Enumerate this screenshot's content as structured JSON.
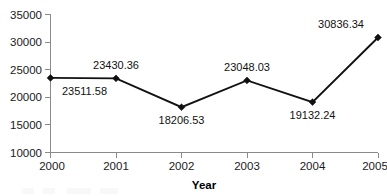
{
  "chart_data": {
    "type": "line",
    "title": "",
    "subtitle": "",
    "xlabel": "Year",
    "ylabel": "",
    "categories": [
      "2000",
      "2001",
      "2002",
      "2003",
      "2004",
      "2005"
    ],
    "values": [
      23511.58,
      23430.36,
      18206.53,
      23048.03,
      19132.24,
      30836.34
    ],
    "point_labels": [
      "23511.58",
      "23430.36",
      "18206.53",
      "23048.03",
      "19132.24",
      "30836.34"
    ],
    "point_label_positions": [
      "below",
      "above",
      "below",
      "above",
      "below",
      "above"
    ],
    "series": [
      {
        "name": "",
        "values": [
          23511.58,
          23430.36,
          18206.53,
          23048.03,
          19132.24,
          30836.34
        ]
      }
    ],
    "ylim": [
      10000,
      35000
    ],
    "ytick_labels": [
      "35000",
      "30000",
      "25000",
      "20000",
      "15000",
      "10000"
    ],
    "ytick_values": [
      35000,
      30000,
      25000,
      20000,
      15000,
      10000
    ],
    "xtick_labels": [
      "2000",
      "2001",
      "2002",
      "2003",
      "2004",
      "2005"
    ],
    "grid": false,
    "legend": false,
    "legend_position": "none",
    "marker": "diamond",
    "line_color": "#111111",
    "axis_color": "#8a8a8a",
    "text_color": "#1a1a1a",
    "background_color": "#ffffff"
  }
}
